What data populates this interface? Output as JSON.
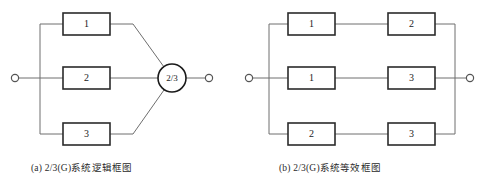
{
  "figure": {
    "panels": [
      {
        "id": "panel-a",
        "caption": "(a)  2/3(G)系统逻辑框图",
        "input_node": "input-terminal",
        "output_node": "output-terminal",
        "gate": {
          "label": "2/3",
          "name": "voting-gate"
        },
        "blocks": [
          {
            "label": "1",
            "row": "top"
          },
          {
            "label": "2",
            "row": "middle"
          },
          {
            "label": "3",
            "row": "bottom"
          }
        ]
      },
      {
        "id": "panel-b",
        "caption": "(b)  2/3(G)系统等效框图",
        "input_node": "input-terminal",
        "output_node": "output-terminal",
        "branches": [
          {
            "row": "top",
            "blocks": [
              {
                "label": "1"
              },
              {
                "label": "2"
              }
            ]
          },
          {
            "row": "middle",
            "blocks": [
              {
                "label": "1"
              },
              {
                "label": "3"
              }
            ]
          },
          {
            "row": "bottom",
            "blocks": [
              {
                "label": "2"
              },
              {
                "label": "3"
              }
            ]
          }
        ]
      }
    ],
    "colors": {
      "wire": "#6e6e6e",
      "box_stroke": "#2b2b2b",
      "text": "#1a1a1a",
      "background": "#ffffff"
    }
  }
}
